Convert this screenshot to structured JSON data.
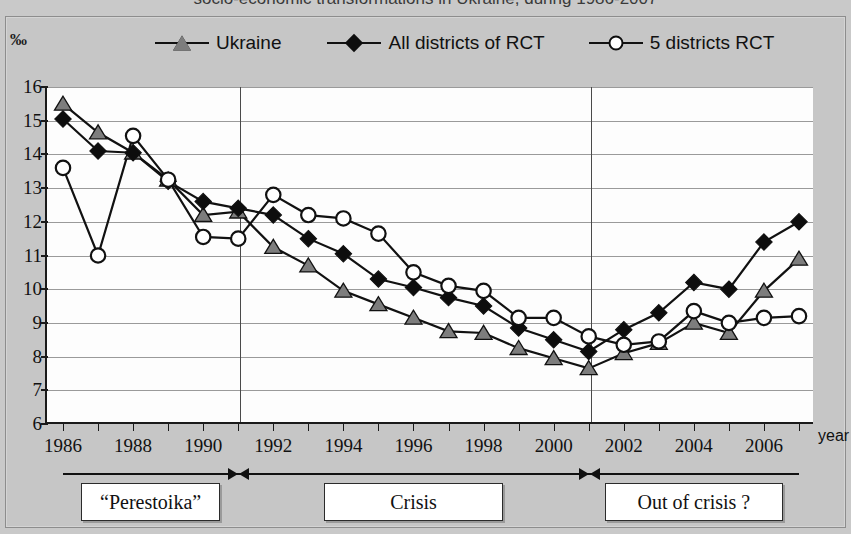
{
  "title": "socio-economic transformations in Ukraine, during 1986-2007",
  "axis": {
    "y_unit_symbol": "‰",
    "y_ticks": [
      16,
      15,
      14,
      13,
      12,
      11,
      10,
      9,
      8,
      7,
      6
    ],
    "x_title": "year",
    "x_tick_labels": [
      "1986",
      "1988",
      "1990",
      "1992",
      "1994",
      "1996",
      "1998",
      "2000",
      "2002",
      "2004",
      "2006"
    ]
  },
  "legend": {
    "items": [
      {
        "label": "Ukraine",
        "marker": "triangle-icon",
        "color": "#7d7d7d"
      },
      {
        "label": "All districts of RCT",
        "marker": "diamond-icon",
        "color": "#0d0d0d"
      },
      {
        "label": "5 districts RCT",
        "marker": "circle-icon",
        "color": "#ffffff"
      }
    ]
  },
  "phases": [
    {
      "label": "“Perestoika”"
    },
    {
      "label": "Crisis"
    },
    {
      "label": "Out of crisis ?"
    }
  ],
  "chart_data": {
    "type": "line",
    "title": "socio-economic transformations in Ukraine, during 1986-2007",
    "xlabel": "year",
    "ylabel": "‰",
    "ylim": [
      6,
      16
    ],
    "xlim": [
      1986,
      2007
    ],
    "grid": true,
    "legend_position": "top",
    "x": [
      1986,
      1987,
      1988,
      1989,
      1990,
      1991,
      1992,
      1993,
      1994,
      1995,
      1996,
      1997,
      1998,
      1999,
      2000,
      2001,
      2002,
      2003,
      2004,
      2005,
      2006,
      2007
    ],
    "series": [
      {
        "name": "Ukraine",
        "marker": "triangle",
        "color": "#7d7d7d",
        "values": [
          15.5,
          14.65,
          14.05,
          13.25,
          12.2,
          12.3,
          11.25,
          10.7,
          9.95,
          9.55,
          9.15,
          8.75,
          8.7,
          8.25,
          7.95,
          7.65,
          8.1,
          8.4,
          9.0,
          8.7,
          9.95,
          10.9
        ]
      },
      {
        "name": "All districts of RCT",
        "marker": "diamond",
        "color": "#0d0d0d",
        "values": [
          15.05,
          14.1,
          14.05,
          13.2,
          12.6,
          12.4,
          12.2,
          11.5,
          11.05,
          10.3,
          10.05,
          9.75,
          9.5,
          8.85,
          8.5,
          8.15,
          8.8,
          9.3,
          10.2,
          10.0,
          11.4,
          12.0
        ]
      },
      {
        "name": "5 districts RCT",
        "marker": "circle",
        "color": "#ffffff",
        "values": [
          13.6,
          11.0,
          14.55,
          13.25,
          11.55,
          11.5,
          12.8,
          12.2,
          12.1,
          11.65,
          10.5,
          10.1,
          9.95,
          9.15,
          9.15,
          8.6,
          8.35,
          8.45,
          9.35,
          9.0,
          9.15,
          9.2
        ]
      }
    ],
    "annotations": [
      {
        "text": "“Perestoika”",
        "span": [
          1986,
          1991
        ]
      },
      {
        "text": "Crisis",
        "span": [
          1991,
          2001
        ]
      },
      {
        "text": "Out of crisis ?",
        "span": [
          2001,
          2007
        ]
      }
    ],
    "phase_dividers": [
      1991,
      2001
    ]
  }
}
